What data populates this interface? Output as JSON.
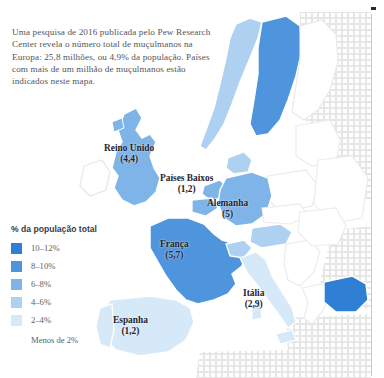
{
  "intro": {
    "text": "Uma pesquisa de 2016 publicada pelo Pew Research Center revela o número total de muçulmanos na Europa: 25,8 milhões, ou 4,9% da população. Países com mais de um milhão de muçulmanos estão indicados neste mapa."
  },
  "legend": {
    "title": "% da população total",
    "items": [
      {
        "label": "10–12%",
        "color": "#2f7fd4"
      },
      {
        "label": "8–10%",
        "color": "#4e95dd"
      },
      {
        "label": "6–8%",
        "color": "#7fb4e8"
      },
      {
        "label": "4–6%",
        "color": "#aed0f1"
      },
      {
        "label": "2–4%",
        "color": "#d6e9f9"
      },
      {
        "label": "Menos de 2%",
        "color": "none"
      }
    ]
  },
  "map": {
    "labels": [
      {
        "name": "Reino Unido",
        "value": "(4,4)",
        "left": 104,
        "top": 143
      },
      {
        "name": "Países Baixos",
        "value": "(1,2)",
        "left": 160,
        "top": 173
      },
      {
        "name": "Alemanha",
        "value": "(5)",
        "left": 207,
        "top": 198
      },
      {
        "name": "França",
        "value": "(5,7)",
        "left": 160,
        "top": 239
      },
      {
        "name": "Itália",
        "value": "(2,9)",
        "left": 243,
        "top": 288
      },
      {
        "name": "Espanha",
        "value": "(1,2)",
        "left": 113,
        "top": 315
      }
    ],
    "colors": {
      "band_10_12": "#2f7fd4",
      "band_8_10": "#4e95dd",
      "band_6_8": "#7fb4e8",
      "band_4_6": "#aed0f1",
      "band_2_4": "#d6e9f9",
      "band_under_2": "#ffffff",
      "sea": "#ffffff",
      "outside": "#f2f2f2",
      "border": "#ffffff"
    }
  }
}
